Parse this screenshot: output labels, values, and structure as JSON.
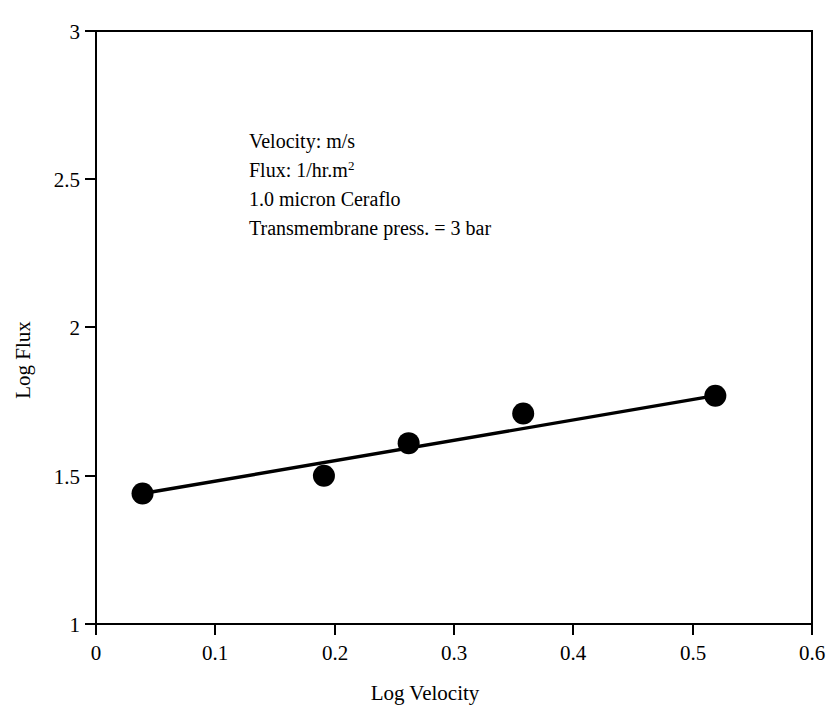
{
  "chart_data": {
    "type": "scatter",
    "title": "",
    "xlabel": "Log Velocity",
    "ylabel": "Log Flux",
    "xlim": [
      0,
      0.6
    ],
    "ylim": [
      1,
      3
    ],
    "xticks": [
      "0",
      "0.1",
      "0.2",
      "0.3",
      "0.4",
      "0.5",
      "0.6"
    ],
    "xtick_values": [
      0,
      0.1,
      0.2,
      0.3,
      0.4,
      0.5,
      0.6
    ],
    "yticks": [
      "1",
      "1.5",
      "2",
      "2.5",
      "3"
    ],
    "ytick_values": [
      1,
      1.5,
      2,
      2.5,
      3
    ],
    "ytick_labels_shown": [
      "1",
      "1.5",
      "2",
      "2.5",
      "3"
    ],
    "grid": false,
    "legend": false,
    "series": [
      {
        "name": "Measured data",
        "marker": "filled-circle",
        "color": "#000000",
        "x": [
          0.039,
          0.191,
          0.262,
          0.358,
          0.519
        ],
        "y": [
          1.44,
          1.5,
          1.61,
          1.71,
          1.77
        ]
      },
      {
        "name": "Linear fit",
        "type": "line",
        "color": "#000000",
        "x": [
          0.039,
          0.519
        ],
        "y": [
          1.44,
          1.77
        ]
      }
    ],
    "annotations": [
      {
        "id": "velocity-units",
        "text": "Velocity: m/s",
        "sup": ""
      },
      {
        "id": "flux-units",
        "text": "Flux: 1/hr.m",
        "sup": "2"
      },
      {
        "id": "membrane-type",
        "text": "1.0 micron Ceraflo",
        "sup": ""
      },
      {
        "id": "transmembrane-pressure",
        "text": "Transmembrane press. = 3 bar",
        "sup": ""
      }
    ]
  },
  "axes": {
    "x_title": "Log Velocity",
    "y_title": "Log Flux",
    "x_tick_0": "0",
    "x_tick_1": "0.1",
    "x_tick_2": "0.2",
    "x_tick_3": "0.3",
    "x_tick_4": "0.4",
    "x_tick_5": "0.5",
    "x_tick_6": "0.6",
    "y_tick_0": "1",
    "y_tick_1": "1.5",
    "y_tick_2": "2",
    "y_tick_3": "2.5",
    "y_tick_4": "3"
  },
  "annotation_block": {
    "line1": "Velocity: m/s",
    "line2_main": "Flux: 1/hr.m",
    "line2_sup": "2",
    "line3": "1.0 micron Ceraflo",
    "line4": "Transmembrane press. = 3 bar"
  },
  "style": {
    "ink_color": "#000000",
    "background_color": "#ffffff"
  }
}
